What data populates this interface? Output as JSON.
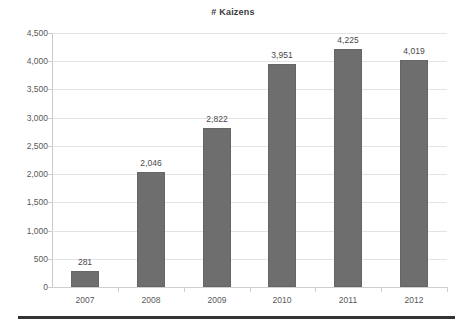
{
  "chart_data": {
    "type": "bar",
    "title": "# Kaizens",
    "xlabel": "",
    "ylabel": "",
    "categories": [
      "2007",
      "2008",
      "2009",
      "2010",
      "2011",
      "2012"
    ],
    "values": [
      281,
      2046,
      2822,
      3951,
      4225,
      4019
    ],
    "value_labels": [
      "281",
      "2,046",
      "2,822",
      "3,951",
      "4,225",
      "4,019"
    ],
    "ylim": [
      0,
      4500
    ],
    "ytick_step": 500,
    "ytick_labels": [
      "0",
      "500",
      "1,000",
      "1,500",
      "2,000",
      "2,500",
      "3,000",
      "3,500",
      "4,000",
      "4,500"
    ],
    "ytick_values": [
      0,
      500,
      1000,
      1500,
      2000,
      2500,
      3000,
      3500,
      4000,
      4500
    ],
    "grid": true,
    "legend": false,
    "legend_position": "none",
    "series": [
      {
        "name": "# Kaizens",
        "values": [
          281,
          2046,
          2822,
          3951,
          4225,
          4019
        ]
      }
    ],
    "colors": {
      "bar_fill": "#6e6e6e",
      "bar_border": "#666666",
      "gridline": "#e3e3e3",
      "axis_line": "#cfcfcf",
      "text": "#4a4a4a",
      "title_text": "#3b3b3b",
      "bottom_rule": "#333333"
    }
  }
}
